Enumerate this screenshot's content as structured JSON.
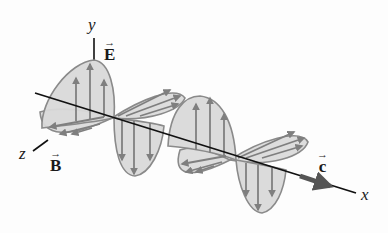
{
  "diagram": {
    "axes": {
      "x_label": "x",
      "y_label": "y",
      "z_label": "z"
    },
    "vectors": {
      "electric_field": {
        "symbol": "E",
        "arrow": "→"
      },
      "magnetic_field": {
        "symbol": "B",
        "arrow": "→"
      },
      "velocity": {
        "symbol": "c",
        "arrow": "→"
      }
    },
    "colors": {
      "lobe_fill": "#d9d9d9",
      "lobe_stroke": "#8a8a8a",
      "field_arrow": "#7f7f7f",
      "axis": "#111111",
      "velocity_arrow": "#555555"
    }
  }
}
